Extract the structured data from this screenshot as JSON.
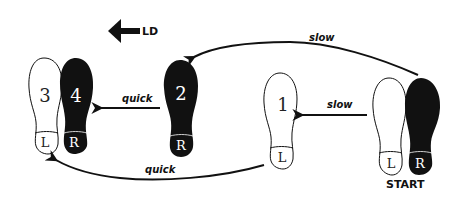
{
  "direction_indicator": {
    "label": "LD"
  },
  "steps": [
    {
      "id": "start-left",
      "number": "",
      "side": "L",
      "foot": "left",
      "fill": "white"
    },
    {
      "id": "start-right",
      "number": "",
      "side": "R",
      "foot": "right",
      "fill": "black"
    },
    {
      "id": "step-1",
      "number": "1",
      "side": "L",
      "foot": "left",
      "fill": "white"
    },
    {
      "id": "step-2",
      "number": "2",
      "side": "R",
      "foot": "right",
      "fill": "black"
    },
    {
      "id": "step-3",
      "number": "3",
      "side": "L",
      "foot": "left",
      "fill": "white"
    },
    {
      "id": "step-4",
      "number": "4",
      "side": "R",
      "foot": "right",
      "fill": "black"
    }
  ],
  "arrows": [
    {
      "from": "start-right",
      "to": "step-2",
      "label": "slow"
    },
    {
      "from": "start-left",
      "to": "step-1",
      "label": "slow"
    },
    {
      "from": "step-2",
      "to": "step-4",
      "label": "quick"
    },
    {
      "from": "step-1",
      "to": "step-3",
      "label": "quick"
    }
  ],
  "start_label": "START",
  "colors": {
    "ink": "#111111",
    "paper": "#ffffff"
  }
}
